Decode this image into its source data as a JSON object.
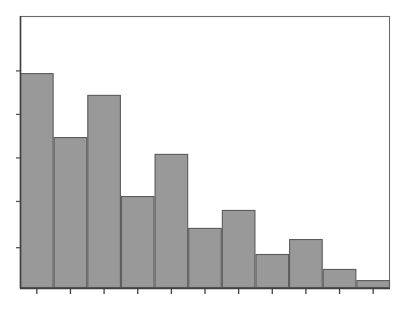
{
  "chart_data": {
    "type": "bar",
    "title": "",
    "subtitle": "",
    "xlabel": "",
    "ylabel": "",
    "categories": [
      "1",
      "2",
      "3",
      "4",
      "5",
      "6",
      "7",
      "8",
      "9",
      "10",
      "11"
    ],
    "values": [
      79.0,
      55.5,
      71.0,
      33.8,
      49.3,
      22.1,
      28.7,
      12.5,
      18.0,
      7.0,
      2.9
    ],
    "series": [
      {
        "name": "frequency",
        "values": [
          79.0,
          55.5,
          71.0,
          33.8,
          49.3,
          22.1,
          28.7,
          12.5,
          18.0,
          7.0,
          2.9
        ]
      }
    ],
    "ylim": [
      0,
      100
    ],
    "xlim": [
      0,
      11
    ],
    "grid": false,
    "legend": false,
    "legend_position": "none",
    "bar_fill_color": "#999999",
    "bar_edge_color": "#5a5a5a",
    "frame_color": "#6b6b6b",
    "axis_color": "#3f3f3f",
    "background_color": "#ffffff",
    "y_tick_positions": [
      15,
      32,
      48,
      64,
      80
    ],
    "y_tick_labels": [
      "",
      "",
      "",
      "",
      ""
    ],
    "x_tick_labels": [
      "",
      "",
      "",
      "",
      "",
      "",
      "",
      "",
      "",
      "",
      ""
    ],
    "annotations": []
  },
  "figure": {
    "plot_area": {
      "left": 20,
      "top": 16,
      "right": 390,
      "bottom": 288
    },
    "bar_count": 11,
    "bar_width": 33.6
  }
}
